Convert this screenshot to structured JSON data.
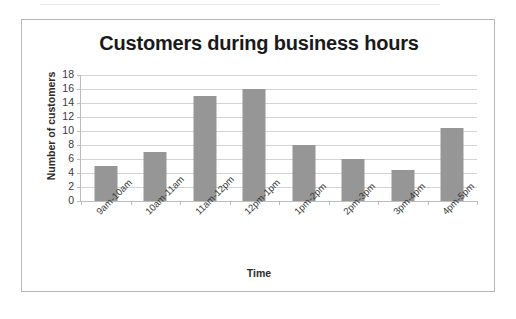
{
  "chart_data": {
    "type": "bar",
    "title": "Customers during business hours",
    "xlabel": "Time",
    "ylabel": "Number of customers",
    "categories": [
      "9am-10am",
      "10am-11am",
      "11am-12pm",
      "12pm-1pm",
      "1pm-2pm",
      "2pm-3pm",
      "3pm-4pm",
      "4pm-5pm"
    ],
    "values": [
      5,
      7,
      15,
      16,
      8,
      6,
      4.5,
      10.5
    ],
    "ylim": [
      0,
      18
    ],
    "ytick_labels": [
      "18",
      "16",
      "14",
      "12",
      "10",
      "8",
      "6",
      "4",
      "2",
      "0"
    ],
    "ytick_values": [
      18,
      16,
      14,
      12,
      10,
      8,
      6,
      4,
      2,
      0
    ],
    "ytick_step": 2,
    "grid": true,
    "legend": false,
    "bar_color": "#969696",
    "gridline_color": "#d4d4d4",
    "axis_color": "#bdbdbd",
    "border_color": "#b8b8b8",
    "background_color": "#ffffff"
  }
}
